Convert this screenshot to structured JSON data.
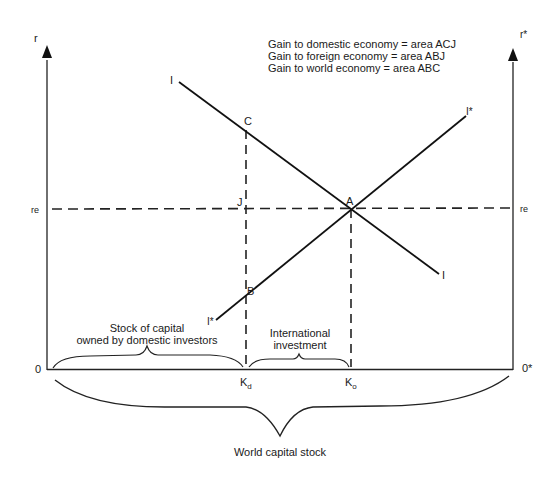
{
  "diagram": {
    "legend": [
      "Gain to domestic economy = area ACJ",
      "Gain to foreign economy = area ABJ",
      "Gain to world economy = area ABC"
    ],
    "axes": {
      "left_axis_label": "r",
      "right_axis_label": "r*",
      "left_origin": "0",
      "right_origin": "0*",
      "left_equilibrium_rate": "re",
      "right_equilibrium_rate": "re"
    },
    "curves": {
      "domestic_curve_label_top": "I",
      "domestic_curve_label_bottom": "I",
      "foreign_curve_label_top": "I*",
      "foreign_curve_label_bottom": "I*"
    },
    "points": {
      "A": "A",
      "B": "B",
      "C": "C",
      "J": "J"
    },
    "x_ticks": {
      "kd_main": "K",
      "kd_sub": "d",
      "ko_main": "K",
      "ko_sub": "o"
    },
    "braces": {
      "domestic_stock_line1": "Stock of capital",
      "domestic_stock_line2": "owned by domestic investors",
      "international_line1": "International",
      "international_line2": "investment",
      "world": "World capital stock"
    }
  }
}
